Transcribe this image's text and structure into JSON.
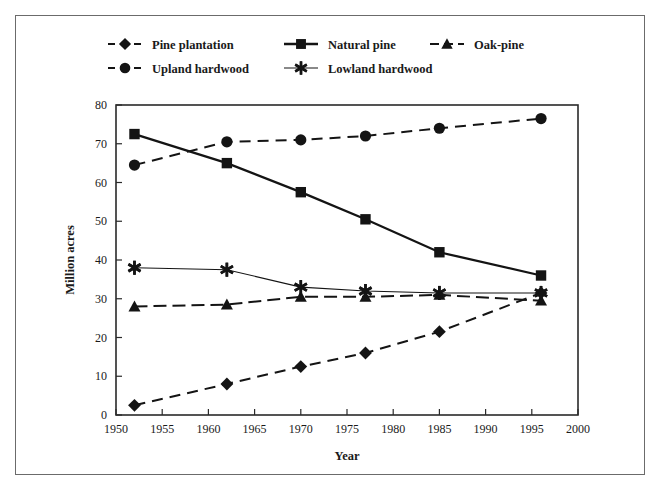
{
  "chart_data": {
    "type": "line",
    "title": "",
    "xlabel": "Year",
    "ylabel": "Million acres",
    "xlim": [
      1950,
      2000
    ],
    "ylim": [
      0,
      80
    ],
    "xticks": [
      1950,
      1955,
      1960,
      1965,
      1970,
      1975,
      1980,
      1985,
      1990,
      1995,
      2000
    ],
    "yticks": [
      0,
      10,
      20,
      30,
      40,
      50,
      60,
      70,
      80
    ],
    "grid": false,
    "legend_position": "top",
    "x": [
      1952,
      1962,
      1970,
      1977,
      1985,
      1996
    ],
    "series": [
      {
        "name": "Pine plantation",
        "marker": "diamond",
        "linestyle": "dashed",
        "color": "#141414",
        "values": [
          2.5,
          8.0,
          12.5,
          16.0,
          21.5,
          31.5
        ]
      },
      {
        "name": "Natural pine",
        "marker": "square",
        "linestyle": "solid",
        "color": "#141414",
        "values": [
          72.5,
          65.0,
          57.5,
          50.5,
          42.0,
          36.0
        ]
      },
      {
        "name": "Oak-pine",
        "marker": "triangle",
        "linestyle": "dashdot",
        "color": "#141414",
        "values": [
          28.0,
          28.5,
          30.5,
          30.5,
          31.0,
          29.5
        ]
      },
      {
        "name": "Upland hardwood",
        "marker": "circle",
        "linestyle": "dashed",
        "color": "#141414",
        "values": [
          64.5,
          70.5,
          71.0,
          72.0,
          74.0,
          76.5
        ]
      },
      {
        "name": "Lowland hardwood",
        "marker": "asterisk",
        "linestyle": "solid-thin",
        "color": "#141414",
        "values": [
          38.0,
          37.5,
          33.0,
          32.0,
          31.5,
          31.5
        ]
      }
    ]
  },
  "legend": {
    "row1": [
      {
        "label": "Pine plantation",
        "marker": "diamond",
        "linestyle": "dashed"
      },
      {
        "label": "Natural pine",
        "marker": "square",
        "linestyle": "solid"
      },
      {
        "label": "Oak-pine",
        "marker": "triangle",
        "linestyle": "dashdot"
      }
    ],
    "row2": [
      {
        "label": "Upland hardwood",
        "marker": "circle",
        "linestyle": "dashed"
      },
      {
        "label": "Lowland hardwood",
        "marker": "asterisk",
        "linestyle": "solid-thin"
      }
    ]
  },
  "axes": {
    "x_title": "Year",
    "y_title": "Million acres",
    "x_tick_labels": [
      "1950",
      "1955",
      "1960",
      "1965",
      "1970",
      "1975",
      "1980",
      "1985",
      "1990",
      "1995",
      "2000"
    ],
    "y_tick_labels": [
      "0",
      "10",
      "20",
      "30",
      "40",
      "50",
      "60",
      "70",
      "80"
    ]
  },
  "colors": {
    "ink": "#141414",
    "frame": "#6b6b6b",
    "axis": "#2a2a2a",
    "background": "#ffffff"
  }
}
